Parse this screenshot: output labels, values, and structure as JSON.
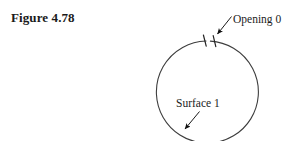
{
  "figure": {
    "caption": "Figure 4.78",
    "background_color": "#ffffff",
    "ink_color": "#333333"
  },
  "diagram": {
    "type": "geometry-line-drawing",
    "shape": "circle",
    "circle": {
      "center_x": 207,
      "center_y": 92,
      "radius": 51,
      "stroke_color": "#3a3a3a",
      "stroke_width": 1,
      "note": "circle extends below the bottom edge of the frame"
    },
    "gap": {
      "name": "opening-gap",
      "position": "top of circle",
      "tick_count": 2
    },
    "labels": [
      {
        "id": "opening",
        "text": "Opening 0",
        "x": 233,
        "y": 22,
        "leader_from_x": 231,
        "leader_from_y": 17,
        "arrow_tip_x": 216,
        "arrow_tip_y": 36
      },
      {
        "id": "surface",
        "text": "Surface 1",
        "x": 176,
        "y": 106,
        "leader_from_x": 199,
        "leader_from_y": 112,
        "arrow_tip_x": 183,
        "arrow_tip_y": 131
      }
    ]
  }
}
